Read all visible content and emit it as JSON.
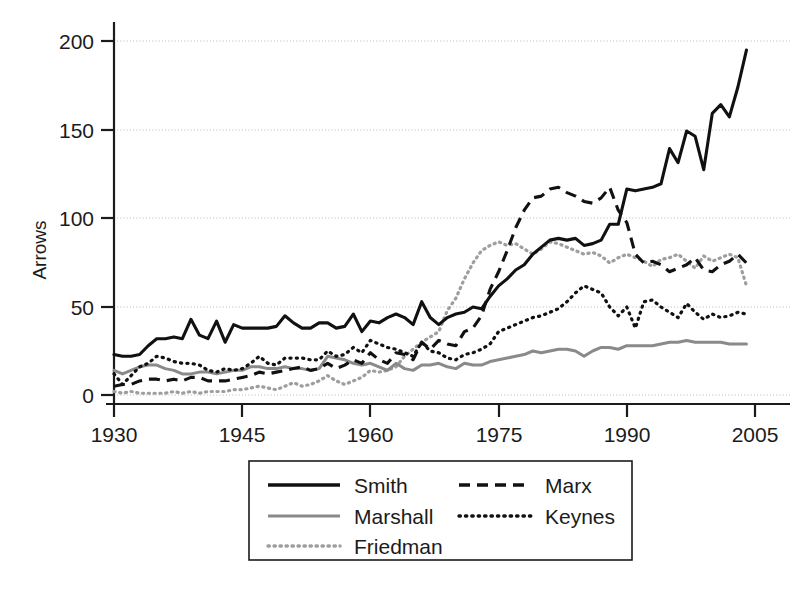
{
  "chart_data": {
    "type": "line",
    "title": "",
    "xlabel": "",
    "ylabel": "Arrows",
    "xlim": [
      1930,
      2005
    ],
    "ylim": [
      0,
      210
    ],
    "grid": true,
    "grid_axis": "y",
    "legend_position": "below-center",
    "x_ticks": [
      1930,
      1945,
      1960,
      1975,
      1990,
      2005
    ],
    "y_ticks": [
      0,
      50,
      100,
      150,
      200
    ],
    "x": [
      1930,
      1931,
      1932,
      1933,
      1934,
      1935,
      1936,
      1937,
      1938,
      1939,
      1940,
      1941,
      1942,
      1943,
      1944,
      1945,
      1946,
      1947,
      1948,
      1949,
      1950,
      1951,
      1952,
      1953,
      1954,
      1955,
      1956,
      1957,
      1958,
      1959,
      1960,
      1961,
      1962,
      1963,
      1964,
      1965,
      1966,
      1967,
      1968,
      1969,
      1970,
      1971,
      1972,
      1973,
      1974,
      1975,
      1976,
      1977,
      1978,
      1979,
      1980,
      1981,
      1982,
      1983,
      1984,
      1985,
      1986,
      1987,
      1988,
      1989,
      1990,
      1991,
      1992,
      1993,
      1994,
      1995,
      1996,
      1997,
      1998,
      1999,
      2000,
      2001,
      2002,
      2003,
      2004
    ],
    "series": [
      {
        "name": "Smith",
        "style": "solid",
        "color": "#111111",
        "width": 3.1,
        "values": [
          23,
          22,
          22,
          23,
          28,
          32,
          32,
          33,
          32,
          43,
          34,
          32,
          42,
          30,
          40,
          38,
          38,
          38,
          38,
          39,
          45,
          41,
          38,
          38,
          41,
          41,
          38,
          39,
          46,
          36,
          42,
          41,
          44,
          46,
          44,
          40,
          53,
          44,
          40,
          44,
          46,
          47,
          50,
          49,
          56,
          62,
          66,
          71,
          74,
          80,
          84,
          88,
          89,
          88,
          89,
          85,
          86,
          88,
          97,
          97,
          117,
          116,
          117,
          118,
          120,
          140,
          132,
          150,
          147,
          128,
          160,
          165,
          158,
          175,
          196
        ]
      },
      {
        "name": "Marx",
        "style": "dashed",
        "color": "#111111",
        "width": 3.1,
        "values": [
          5,
          6,
          6,
          8,
          9,
          9,
          8,
          9,
          8,
          10,
          10,
          8,
          8,
          8,
          9,
          10,
          11,
          13,
          12,
          13,
          14,
          15,
          16,
          14,
          15,
          18,
          15,
          17,
          20,
          18,
          24,
          20,
          18,
          24,
          23,
          20,
          30,
          26,
          31,
          29,
          28,
          36,
          38,
          45,
          60,
          70,
          82,
          95,
          105,
          112,
          113,
          117,
          118,
          115,
          113,
          110,
          109,
          112,
          118,
          105,
          98,
          80,
          75,
          76,
          74,
          70,
          72,
          74,
          78,
          71,
          70,
          74,
          76,
          80,
          75
        ]
      },
      {
        "name": "Keynes",
        "style": "dotted",
        "color": "#111111",
        "width": 3.2,
        "values": [
          12,
          6,
          11,
          16,
          18,
          22,
          21,
          19,
          18,
          18,
          17,
          14,
          13,
          15,
          14,
          15,
          18,
          22,
          18,
          17,
          21,
          21,
          21,
          20,
          20,
          25,
          22,
          23,
          27,
          24,
          31,
          29,
          27,
          26,
          24,
          22,
          30,
          25,
          24,
          21,
          20,
          23,
          24,
          26,
          29,
          36,
          38,
          40,
          42,
          44,
          45,
          47,
          49,
          53,
          58,
          62,
          60,
          58,
          50,
          45,
          50,
          38,
          53,
          54,
          50,
          47,
          44,
          52,
          47,
          43,
          46,
          44,
          45,
          47,
          46
        ]
      },
      {
        "name": "Marshall",
        "style": "solid",
        "color": "#8a8a8a",
        "width": 3.0,
        "values": [
          14,
          12,
          14,
          16,
          17,
          17,
          15,
          14,
          12,
          12,
          13,
          13,
          12,
          13,
          14,
          14,
          16,
          16,
          15,
          15,
          16,
          15,
          15,
          14,
          15,
          22,
          21,
          20,
          18,
          17,
          18,
          16,
          14,
          18,
          15,
          14,
          17,
          17,
          18,
          16,
          15,
          18,
          17,
          17,
          19,
          20,
          21,
          22,
          23,
          25,
          24,
          25,
          26,
          26,
          25,
          22,
          25,
          27,
          27,
          26,
          28,
          28,
          28,
          28,
          29,
          30,
          30,
          31,
          30,
          30,
          30,
          30,
          29,
          29,
          29
        ]
      },
      {
        "name": "Friedman",
        "style": "dotted",
        "color": "#9e9e9e",
        "width": 3.2,
        "values": [
          2,
          1,
          2,
          1,
          1,
          1,
          1,
          2,
          1,
          2,
          1,
          2,
          2,
          2,
          3,
          3,
          4,
          5,
          4,
          3,
          5,
          7,
          5,
          6,
          8,
          11,
          8,
          6,
          8,
          10,
          14,
          13,
          14,
          16,
          22,
          26,
          30,
          33,
          36,
          48,
          55,
          66,
          75,
          82,
          85,
          87,
          85,
          86,
          83,
          80,
          83,
          87,
          86,
          84,
          82,
          80,
          81,
          79,
          75,
          78,
          80,
          78,
          76,
          73,
          77,
          78,
          80,
          76,
          72,
          79,
          76,
          78,
          80,
          78,
          62
        ]
      }
    ]
  },
  "axes": {
    "y_axis_title": "Arrows",
    "x_tick_labels": [
      "1930",
      "1945",
      "1960",
      "1975",
      "1990",
      "2005"
    ],
    "y_tick_labels": [
      "0",
      "50",
      "100",
      "150",
      "200"
    ]
  },
  "legend": {
    "entries": [
      {
        "label": "Smith",
        "style": "solid",
        "color": "#111111"
      },
      {
        "label": "Marx",
        "style": "dashed",
        "color": "#111111"
      },
      {
        "label": "Marshall",
        "style": "solid",
        "color": "#8a8a8a"
      },
      {
        "label": "Keynes",
        "style": "dotted",
        "color": "#111111"
      },
      {
        "label": "Friedman",
        "style": "dotted",
        "color": "#9e9e9e"
      }
    ]
  }
}
